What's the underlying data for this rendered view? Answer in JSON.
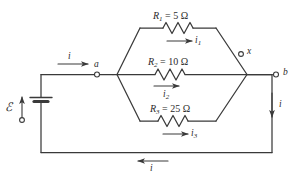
{
  "figure": {
    "type": "circuit-diagram",
    "background_color": "#ffffff",
    "line_color": "#3a3a3a"
  },
  "source": {
    "emf_symbol": "ℰ",
    "name": "emf-source",
    "arrow_direction": "up",
    "terminal_marker": "open-circle"
  },
  "nodes": [
    {
      "id": "a",
      "label": "a",
      "marker": "open-circle"
    },
    {
      "id": "b",
      "label": "b",
      "marker": "open-circle"
    },
    {
      "id": "x",
      "label": "x",
      "marker": "open-circle"
    }
  ],
  "branches": [
    {
      "id": "branch-1",
      "resistor_label": "R",
      "resistor_sub": "1",
      "equals": " = ",
      "value": "5 Ω",
      "full_label": "R₁ = 5 Ω",
      "resistance_ohms": 5,
      "current_label": "i",
      "current_sub": "1",
      "current_direction": "right"
    },
    {
      "id": "branch-2",
      "resistor_label": "R",
      "resistor_sub": "2",
      "equals": " = ",
      "value": "10 Ω",
      "full_label": "R₂ = 10 Ω",
      "resistance_ohms": 10,
      "current_label": "i",
      "current_sub": "2",
      "current_direction": "right"
    },
    {
      "id": "branch-3",
      "resistor_label": "R",
      "resistor_sub": "3",
      "equals": " = ",
      "value": "25 Ω",
      "full_label": "R₃ = 25 Ω",
      "resistance_ohms": 25,
      "current_label": "i",
      "current_sub": "3",
      "current_direction": "right"
    }
  ],
  "main_currents": [
    {
      "id": "current-top-left",
      "label": "i",
      "direction": "right",
      "position": "top-left wire into node a"
    },
    {
      "id": "current-right",
      "label": "i",
      "direction": "down",
      "position": "right vertical wire below node b"
    },
    {
      "id": "current-bottom",
      "label": "i",
      "direction": "left",
      "position": "bottom return wire"
    }
  ]
}
